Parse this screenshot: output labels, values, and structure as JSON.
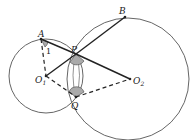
{
  "diagram": {
    "type": "geometry",
    "colors": {
      "stroke": "#555555",
      "bold": "#222222",
      "fill_angle": "#9a9a9a",
      "background": "#ffffff"
    },
    "points": {
      "A": {
        "label": "A",
        "x": 41,
        "y": 39
      },
      "B": {
        "label": "B",
        "x": 125,
        "y": 17
      },
      "P": {
        "label": "P",
        "x": 76,
        "y": 54
      },
      "Q": {
        "label": "Q",
        "x": 76,
        "y": 97
      },
      "O1": {
        "label": "O",
        "sub": "1",
        "x": 46,
        "y": 76
      },
      "O2": {
        "label": "O",
        "sub": "2",
        "x": 130,
        "y": 79
      }
    },
    "angle_label": "1",
    "circles": [
      {
        "name": "circle-O1",
        "cx": 46,
        "cy": 76,
        "r": 37
      },
      {
        "name": "circle-O2",
        "cx": 128,
        "cy": 79,
        "r": 61
      }
    ],
    "segments_solid": [
      "A-P",
      "P-O2",
      "P-B",
      "O1-P"
    ],
    "segments_dashed": [
      "A-O1",
      "O1-Q",
      "Q-O2"
    ]
  }
}
